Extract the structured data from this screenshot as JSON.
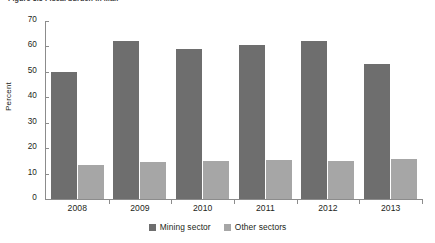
{
  "figure": {
    "caption": "Figure 3.5  Fiscal burden in Mali"
  },
  "legend": {
    "position": "bottom-center",
    "items": [
      {
        "label": "Mining sector",
        "color": "#6e6e6e",
        "swatch_name": "legend-swatch-mining"
      },
      {
        "label": "Other sectors",
        "color": "#a6a6a6",
        "swatch_name": "legend-swatch-other"
      }
    ]
  },
  "chart_data": {
    "type": "bar",
    "title": "Figure 3.5  Fiscal burden in Mali",
    "xlabel": "",
    "ylabel": "Percent",
    "ylim": [
      0,
      70
    ],
    "yticks": [
      0,
      10,
      20,
      30,
      40,
      50,
      60,
      70
    ],
    "ytick_labels": [
      "0",
      "10",
      "20",
      "30",
      "40",
      "50",
      "60",
      "70"
    ],
    "grid": false,
    "categories": [
      "2008",
      "2009",
      "2010",
      "2011",
      "2012",
      "2013"
    ],
    "series": [
      {
        "name": "Mining sector",
        "color": "#6e6e6e",
        "values": [
          50.0,
          62.0,
          59.0,
          60.5,
          62.0,
          53.0
        ]
      },
      {
        "name": "Other sectors",
        "color": "#a6a6a6",
        "values": [
          13.5,
          14.5,
          14.8,
          15.2,
          15.0,
          15.6
        ]
      }
    ]
  }
}
